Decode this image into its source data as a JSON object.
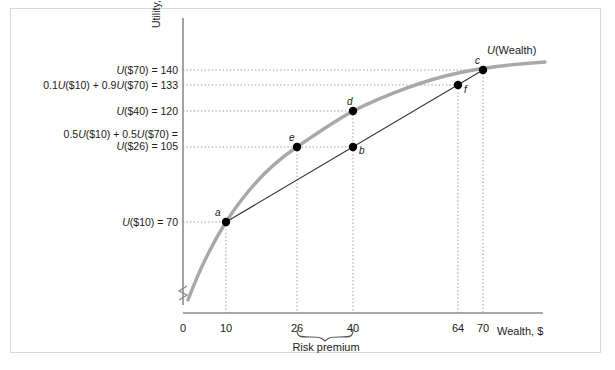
{
  "figure": {
    "background": "#ffffff",
    "frame_color": "#d8d8d8",
    "curve_color": "#a8a8a8",
    "chord_color": "#333333",
    "axis_color": "#8c8c8c",
    "grid_color": "#9a9a9a",
    "point_color": "#000000",
    "axis_y_title_prefix": "Utility, ",
    "axis_y_title_symbol": "U",
    "axis_x_title": "Wealth, $",
    "curve_label_symbol": "U",
    "curve_label_rest": "(Wealth)",
    "risk_premium_label": "Risk premium"
  },
  "chart_data": {
    "type": "line",
    "title": "",
    "xlabel": "Wealth, $",
    "ylabel": "Utility, U",
    "xlim": [
      0,
      80
    ],
    "ylim": [
      0,
      150
    ],
    "grid": "dotted-guides-only",
    "legend": "none",
    "series": [
      {
        "name": "U(Wealth)",
        "type": "curve",
        "description": "Concave utility of wealth function",
        "x": [
          2,
          6,
          10,
          16,
          22,
          26,
          32,
          40,
          48,
          56,
          64,
          70,
          76,
          82
        ],
        "y": [
          20,
          47,
          70,
          92,
          108,
          116,
          127,
          139,
          147,
          153,
          158,
          161,
          164,
          166
        ]
      },
      {
        "name": "chord a-c",
        "type": "line",
        "description": "Straight chord connecting point a to point c (expected utility line)",
        "x": [
          10,
          70
        ],
        "y": [
          70,
          140
        ]
      }
    ],
    "points": [
      {
        "id": "a",
        "label": "a",
        "x": 10,
        "y": 70,
        "label_pos": "above-left"
      },
      {
        "id": "e",
        "label": "e",
        "x": 26,
        "y": 105,
        "label_pos": "above-left"
      },
      {
        "id": "b",
        "label": "b",
        "x": 40,
        "y": 105,
        "label_pos": "right"
      },
      {
        "id": "d",
        "label": "d",
        "x": 40,
        "y": 120,
        "label_pos": "above"
      },
      {
        "id": "f",
        "label": "f",
        "x": 64,
        "y": 133,
        "label_pos": "right"
      },
      {
        "id": "c",
        "label": "c",
        "x": 70,
        "y": 140,
        "label_pos": "above-left"
      }
    ],
    "y_ticks": [
      {
        "value": 140,
        "lines": [
          "U($70) = 140"
        ],
        "html_lines": [
          "<i>U</i>($70) = 140"
        ]
      },
      {
        "value": 133,
        "lines": [
          "0.1U($10) + 0.9U($70) = 133"
        ],
        "html_lines": [
          "0.1<i>U</i>($10) + 0.9<i>U</i>($70) = 133"
        ]
      },
      {
        "value": 120,
        "lines": [
          "U($40) = 120"
        ],
        "html_lines": [
          "<i>U</i>($40) = 120"
        ]
      },
      {
        "value": 105,
        "lines": [
          "0.5U($10) + 0.5U($70) =",
          "U($26) = 105"
        ],
        "html_lines": [
          "0.5<i>U</i>($10) + 0.5<i>U</i>($70) =",
          "<i>U</i>($26) = 105"
        ]
      },
      {
        "value": 70,
        "lines": [
          "U($10) = 70"
        ],
        "html_lines": [
          "<i>U</i>($10) = 70"
        ]
      }
    ],
    "x_ticks": [
      {
        "value": 0,
        "label": "0"
      },
      {
        "value": 10,
        "label": "10"
      },
      {
        "value": 26,
        "label": "26"
      },
      {
        "value": 40,
        "label": "40"
      },
      {
        "value": 64,
        "label": "64"
      },
      {
        "value": 70,
        "label": "70"
      }
    ],
    "annotations": [
      {
        "name": "risk-premium-bracket",
        "text": "Risk premium",
        "from_x": 26,
        "to_x": 40,
        "position": "below-x-axis"
      },
      {
        "name": "y-axis-break",
        "text": "",
        "description": "zigzag break symbol on vertical axis near origin"
      }
    ]
  }
}
